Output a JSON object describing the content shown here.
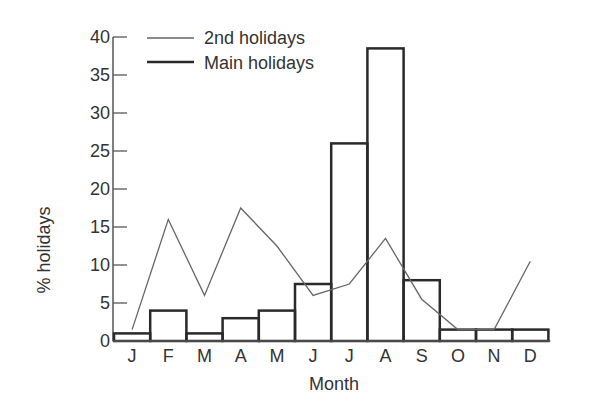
{
  "chart_data": {
    "type": "bar",
    "title": "",
    "xlabel": "Month",
    "ylabel": "% holidays",
    "ylim": [
      0,
      40
    ],
    "yticks": [
      0,
      5,
      10,
      15,
      20,
      25,
      30,
      35,
      40
    ],
    "grid": false,
    "legend_position": "top-center",
    "categories": [
      "J",
      "F",
      "M",
      "A",
      "M",
      "J",
      "J",
      "A",
      "S",
      "O",
      "N",
      "D"
    ],
    "series": [
      {
        "name": "Main holidays",
        "type": "bar",
        "style": "thick outlined bars",
        "values": [
          1,
          4,
          1,
          3,
          4,
          7.5,
          26,
          38.5,
          8,
          1.5,
          1.5,
          1.5
        ]
      },
      {
        "name": "2nd holidays",
        "type": "line",
        "style": "thin line",
        "values": [
          1.5,
          16,
          6,
          17.5,
          12.5,
          6,
          7.5,
          13.5,
          5.5,
          1.5,
          1.5,
          10.5
        ]
      }
    ],
    "legend": [
      "2nd holidays",
      "Main holidays"
    ]
  },
  "colors": {
    "axis": "#555555",
    "bars": "#2a2a2a",
    "line": "#666666",
    "text": "#333333"
  }
}
